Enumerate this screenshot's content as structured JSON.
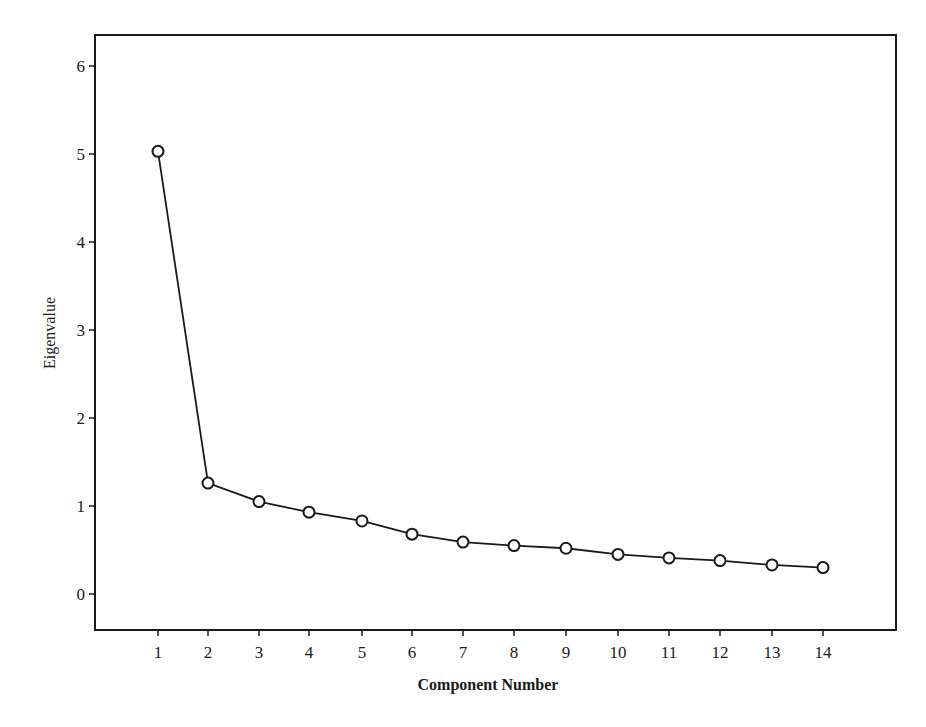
{
  "chart_data": {
    "type": "line",
    "title": "",
    "xlabel": "Component Number",
    "ylabel": "Eigenvalue",
    "x": [
      1,
      2,
      3,
      4,
      5,
      6,
      7,
      8,
      9,
      10,
      11,
      12,
      13,
      14
    ],
    "categories": [
      "1",
      "2",
      "3",
      "4",
      "5",
      "6",
      "7",
      "8",
      "9",
      "10",
      "11",
      "12",
      "13",
      "14"
    ],
    "series": [
      {
        "name": "Eigenvalue",
        "marker": "open-circle",
        "values": [
          5.03,
          1.26,
          1.05,
          0.93,
          0.83,
          0.68,
          0.59,
          0.55,
          0.52,
          0.45,
          0.41,
          0.38,
          0.33,
          0.3
        ]
      }
    ],
    "yticks": [
      0,
      1,
      2,
      3,
      4,
      5,
      6
    ],
    "xticks": [
      1,
      2,
      3,
      4,
      5,
      6,
      7,
      8,
      9,
      10,
      11,
      12,
      13,
      14
    ],
    "ylim": [
      -0.35,
      6.4
    ],
    "xlim": [
      -0.2,
      15.5
    ],
    "grid": false,
    "legend": "none",
    "line_color": "#1a1a1a"
  }
}
